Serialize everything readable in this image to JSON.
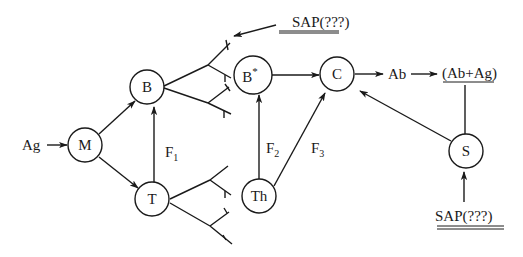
{
  "diagram": {
    "type": "immune-response-flow",
    "nodes": {
      "M": {
        "label": "M"
      },
      "B": {
        "label": "B"
      },
      "T": {
        "label": "T"
      },
      "Bstar": {
        "label": "B",
        "superscript": "*"
      },
      "C": {
        "label": "C"
      },
      "Th": {
        "label": "Th"
      },
      "S": {
        "label": "S"
      }
    },
    "labels": {
      "antigen": "Ag",
      "antibody": "Ab",
      "complex": "(Ab+Ag)",
      "sap_top": "SAP(???)",
      "sap_bottom": "SAP(???)",
      "f1": {
        "base": "F",
        "sub": "1"
      },
      "f2": {
        "base": "F",
        "sub": "2"
      },
      "f3": {
        "base": "F",
        "sub": "3"
      }
    },
    "edges": [
      {
        "from": "Ag",
        "to": "M",
        "arrow": true
      },
      {
        "from": "M",
        "to": "B",
        "arrow": true
      },
      {
        "from": "M",
        "to": "T",
        "arrow": true
      },
      {
        "from": "T",
        "to": "B",
        "arrow": true,
        "label": "F1"
      },
      {
        "from": "B*",
        "to": "C",
        "arrow": true
      },
      {
        "from": "Th",
        "to": "B*",
        "arrow": true,
        "label": "F2"
      },
      {
        "from": "Th",
        "to": "C",
        "arrow": true,
        "label": "F3"
      },
      {
        "from": "C",
        "to": "Ab",
        "arrow": true
      },
      {
        "from": "Ab",
        "to": "(Ab+Ag)",
        "arrow": true
      },
      {
        "from": "(Ab+Ag)",
        "to": "S",
        "arrow": false
      },
      {
        "from": "S",
        "to": "C",
        "arrow": true
      },
      {
        "from": "SAP(???) bottom",
        "to": "S",
        "arrow": true
      },
      {
        "from": "SAP(???) top",
        "to": "B branches",
        "arrow": true
      }
    ]
  }
}
